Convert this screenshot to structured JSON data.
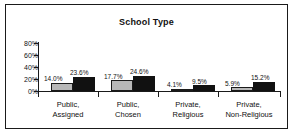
{
  "chart_data": {
    "type": "bar",
    "title": "School Type",
    "xlabel": "",
    "ylabel": "",
    "ylim": [
      0,
      80
    ],
    "grid": false,
    "legend": "none",
    "ytick_labels": [
      "80%",
      "60%",
      "40%",
      "20%",
      "0%"
    ],
    "ytick_values": [
      80,
      60,
      40,
      20,
      0
    ],
    "categories": [
      "Public,\nAssigned",
      "Public,\nChosen",
      "Private,\nReligious",
      "Private,\nNon-Religious"
    ],
    "category_lines": [
      [
        "Public,",
        "Assigned"
      ],
      [
        "Public,",
        "Chosen"
      ],
      [
        "Private,",
        "Religious"
      ],
      [
        "Private,",
        "Non-Religious"
      ]
    ],
    "series": [
      {
        "name": "series-1",
        "color": "#b8b8b8",
        "values": [
          14.0,
          17.7,
          4.1,
          5.9
        ],
        "labels": [
          "14.0%",
          "17.7%",
          "4.1%",
          "5.9%"
        ]
      },
      {
        "name": "series-2",
        "color": "#111111",
        "values": [
          23.6,
          24.6,
          9.5,
          15.2
        ],
        "labels": [
          "23.6%",
          "24.6%",
          "9.5%",
          "15.2%"
        ]
      }
    ]
  },
  "colors": {
    "axis": "#1a1a1a",
    "frame": "#1a1a1a",
    "text": "#111111",
    "bar_light": "#b8b8b8",
    "bar_dark": "#111111",
    "background": "#ffffff"
  }
}
